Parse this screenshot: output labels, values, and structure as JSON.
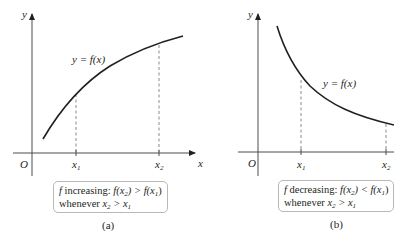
{
  "panel_a": {
    "y_axis_label": "y",
    "x_axis_label": "x",
    "origin_label": "O",
    "x1_label": "x",
    "x1_sub": "1",
    "x2_label": "x",
    "x2_sub": "2",
    "curve_label": "y = f(x)",
    "caption_line1_f": "f",
    "caption_line1_text": " increasing: ",
    "caption_line1_rel": "f(x",
    "caption_line1_sub2": "2",
    "caption_line1_mid": ") > f(x",
    "caption_line1_sub1": "1",
    "caption_line1_end": ")",
    "caption_line2_text": "whenever ",
    "caption_line2_x": "x",
    "caption_line2_sub2": "2",
    "caption_line2_mid": " > x",
    "caption_line2_sub1": "1",
    "panel_label": "(a)"
  },
  "panel_b": {
    "y_axis_label": "y",
    "x_axis_label": "x",
    "origin_label": "O",
    "x1_label": "x",
    "x1_sub": "1",
    "x2_label": "x",
    "x2_sub": "2",
    "curve_label": "y = f(x)",
    "caption_line1_f": "f",
    "caption_line1_text": " decreasing: ",
    "caption_line1_rel": "f(x",
    "caption_line1_sub2": "2",
    "caption_line1_mid": ") < f(x",
    "caption_line1_sub1": "1",
    "caption_line1_end": ")",
    "caption_line2_text": "whenever ",
    "caption_line2_x": "x",
    "caption_line2_sub2": "2",
    "caption_line2_mid": " > x",
    "caption_line2_sub1": "1",
    "panel_label": "(b)"
  },
  "colors": {
    "ink": "#231f20",
    "axis": "#4d4d4d",
    "box_border": "#b8b8b8"
  }
}
